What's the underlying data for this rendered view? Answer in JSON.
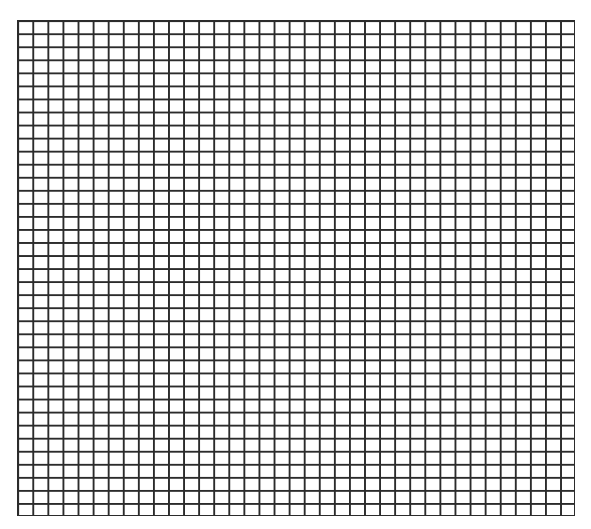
{
  "grid": {
    "columns": 37,
    "rows": 38,
    "line_color": "#2b2b2b",
    "background_color": "#ffffff",
    "cell_width_px": 15.08,
    "cell_height_px": 13.05
  }
}
